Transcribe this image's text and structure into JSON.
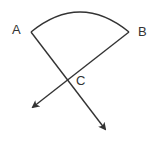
{
  "diagram": {
    "labels": {
      "a": "A",
      "b": "B",
      "c": "C"
    },
    "stroke_color": "#333333",
    "points": {
      "A": [
        31,
        32
      ],
      "B": [
        129,
        32
      ],
      "C": [
        67,
        80
      ],
      "arrow_left_tip": [
        33,
        107
      ],
      "arrow_right_tip": [
        105,
        129
      ]
    },
    "shapes": [
      {
        "type": "arc",
        "from": "A",
        "to": "B",
        "description": "circular arc connecting A and B, bulging upward"
      },
      {
        "type": "ray",
        "from": "A",
        "through": "C",
        "to": "arrow_right_tip",
        "arrowhead": true
      },
      {
        "type": "ray",
        "from": "B",
        "through": "C",
        "to": "arrow_left_tip",
        "arrowhead": true
      }
    ]
  }
}
